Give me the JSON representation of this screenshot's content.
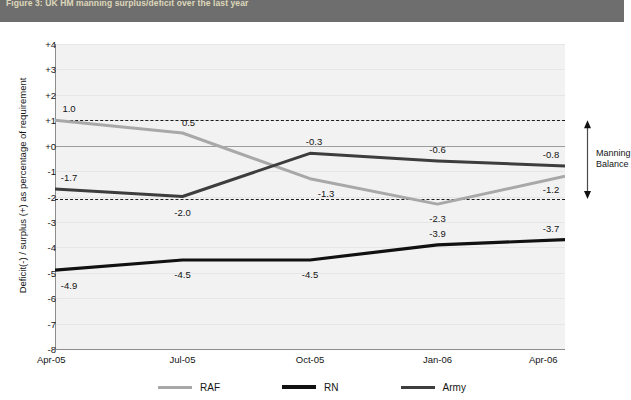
{
  "header": {
    "title": "Figure 3: UK HM manning surplus/deficit over the last year"
  },
  "chart_data": {
    "type": "line",
    "title": "Figure 3: UK HM manning surplus/deficit over the last year",
    "xlabel": "",
    "ylabel": "Deficit(-) / surplus (+) as percentage of requirement",
    "categories": [
      "Apr-05",
      "Jul-05",
      "Oct-05",
      "Jan-06",
      "Apr-06"
    ],
    "ylim": [
      -8,
      4
    ],
    "ytick_labels": [
      "+4",
      "+3",
      "+2",
      "+1",
      "+0",
      "-1",
      "-2",
      "-3",
      "-4",
      "-5",
      "-6",
      "-7",
      "-8"
    ],
    "ytick_values": [
      4,
      3,
      2,
      1,
      0,
      -1,
      -2,
      -3,
      -4,
      -5,
      -6,
      -7,
      -8
    ],
    "grid": true,
    "legend_position": "bottom",
    "series": [
      {
        "name": "RAF",
        "color": "#a8a8a8",
        "width": 3.0,
        "values": [
          1.0,
          0.5,
          -1.3,
          -2.3,
          -1.2
        ],
        "labels": [
          "1.0",
          "0.5",
          "-1.3",
          "-2.3",
          "-1.2"
        ]
      },
      {
        "name": "RN",
        "color": "#111111",
        "width": 3.2,
        "values": [
          -4.9,
          -4.5,
          -4.5,
          -3.9,
          -3.7
        ],
        "labels": [
          "-4.9",
          "-4.5",
          "-4.5",
          "-3.9",
          "-3.7"
        ]
      },
      {
        "name": "Army",
        "color": "#3d3d3d",
        "width": 3.0,
        "values": [
          -1.7,
          -2.0,
          -0.3,
          -0.6,
          -0.8
        ],
        "labels": [
          "-1.7",
          "-2.0",
          "-0.3",
          "-0.6",
          "-0.8"
        ]
      }
    ],
    "reference_lines": [
      {
        "name": "zero-line",
        "value": 0,
        "style": "solid",
        "color": "#9d9d9d"
      },
      {
        "name": "manning-balance-upper",
        "value": 1.0,
        "style": "dashed",
        "color": "#1c1c1c"
      },
      {
        "name": "manning-balance-lower",
        "value": -2.1,
        "style": "dashed",
        "color": "#1c1c1c"
      }
    ],
    "annotations": [
      {
        "name": "manning-balance",
        "text_line1": "Manning",
        "text_line2": "Balance",
        "from": 1.0,
        "to": -2.1
      }
    ]
  }
}
